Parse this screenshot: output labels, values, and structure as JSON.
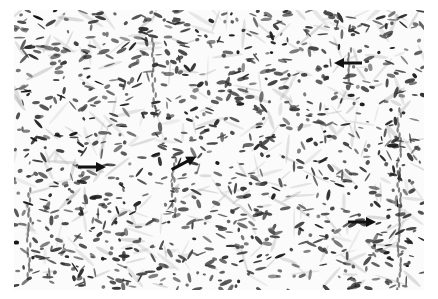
{
  "image": {
    "type": "histology-micrograph",
    "description": "Grayscale photomicrograph of spindle-cell tissue with dark elongated nuclei in a pale fibrous stroma",
    "colors": {
      "background": "#ffffff",
      "tissue": "#f6f6f6",
      "nuclei": "#1e1e1e",
      "arrow": "#111111"
    },
    "arrows": [
      {
        "id": "arrow-1",
        "direction": "left",
        "x": 348,
        "y": 63
      },
      {
        "id": "arrow-2",
        "direction": "right",
        "x": 92,
        "y": 167
      },
      {
        "id": "arrow-3",
        "direction": "up-right",
        "x": 184,
        "y": 163
      },
      {
        "id": "arrow-4",
        "direction": "right",
        "x": 362,
        "y": 222
      }
    ]
  }
}
